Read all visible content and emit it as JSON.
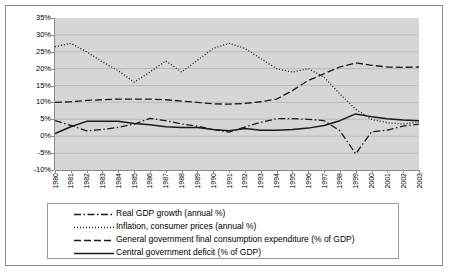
{
  "chart_data": {
    "type": "line",
    "title": "",
    "xlabel": "",
    "ylabel": "",
    "ylim": [
      -10,
      35
    ],
    "ytick_labels": [
      "35%",
      "30%",
      "25%",
      "20%",
      "15%",
      "10%",
      "5%",
      "0%",
      "-5%",
      "-10%"
    ],
    "ytick_values": [
      35,
      30,
      25,
      20,
      15,
      10,
      5,
      0,
      -5,
      -10
    ],
    "grid": true,
    "legend_position": "bottom",
    "categories": [
      "1980",
      "1981",
      "1982",
      "1983",
      "1984",
      "1985",
      "1986",
      "1987",
      "1988",
      "1989",
      "1990",
      "1991",
      "1992",
      "1993",
      "1994",
      "1995",
      "1996",
      "1997",
      "1998",
      "1999",
      "2000",
      "2001",
      "2002",
      "2003"
    ],
    "series": [
      {
        "name": "Real GDP growth (annual %)",
        "style": "dash-dot",
        "values": [
          4.6,
          3.2,
          1.6,
          2.0,
          2.6,
          3.6,
          5.3,
          4.6,
          3.6,
          3.0,
          2.0,
          1.2,
          2.7,
          4.1,
          5.2,
          5.2,
          5.0,
          4.6,
          1.6,
          -5.2,
          1.3,
          1.8,
          3.0,
          3.6
        ]
      },
      {
        "name": "Inflation, consumer prices (annual %)",
        "style": "dotted",
        "values": [
          26.5,
          27.5,
          25.0,
          22.0,
          19.4,
          16.0,
          19.0,
          22.3,
          19.0,
          22.5,
          26.0,
          27.5,
          26.0,
          23.0,
          20.0,
          19.0,
          20.0,
          17.5,
          12.5,
          8.0,
          5.0,
          4.0,
          3.6,
          4.2
        ]
      },
      {
        "name": "General government final consumption expenditure (% of GDP)",
        "style": "dashed",
        "values": [
          10.0,
          10.2,
          10.6,
          10.8,
          11.0,
          11.0,
          11.0,
          10.8,
          10.4,
          10.0,
          9.6,
          9.5,
          9.7,
          10.2,
          11.0,
          13.5,
          16.5,
          18.5,
          20.5,
          21.7,
          21.0,
          20.5,
          20.4,
          20.5
        ]
      },
      {
        "name": "Central government deficit (% of GDP)",
        "style": "solid",
        "values": [
          0.8,
          2.8,
          4.4,
          4.4,
          4.4,
          3.8,
          3.4,
          2.8,
          2.6,
          2.6,
          2.0,
          1.6,
          2.3,
          1.8,
          1.8,
          2.0,
          2.4,
          3.2,
          4.6,
          6.6,
          5.8,
          5.2,
          4.8,
          4.6
        ]
      }
    ]
  },
  "legend": {
    "items": [
      {
        "label": "Real GDP growth (annual %)",
        "style": "dash-dot"
      },
      {
        "label": "Inflation, consumer prices (annual %)",
        "style": "dotted"
      },
      {
        "label": "General government final consumption expenditure (% of GDP)",
        "style": "dashed"
      },
      {
        "label": "Central government deficit (% of GDP)",
        "style": "solid"
      }
    ]
  },
  "colors": {
    "plot_background": "#d6d6d6",
    "gridline": "#b0b0b0",
    "axis": "#8a8a8a",
    "series": "#1a1a1a",
    "page_background": "#ffffff",
    "border": "#8a8a8a"
  }
}
